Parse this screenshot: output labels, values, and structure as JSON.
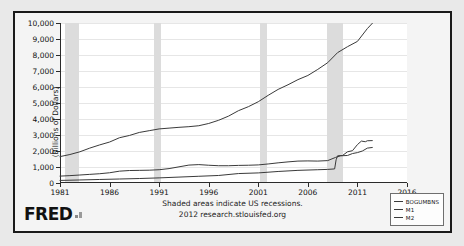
{
  "figure": {
    "logo": "FRED",
    "logo_mark": "bar-mark",
    "caption_line1": "Shaded areas indicate US recessions.",
    "caption_line2": "2012 research.stlouisfed.org"
  },
  "legend": {
    "position": "bottom-right",
    "items": [
      {
        "label": "BOGUMBNS",
        "color": "#3a3a3a"
      },
      {
        "label": "M1",
        "color": "#3a3a3a"
      },
      {
        "label": "M2",
        "color": "#3a3a3a"
      }
    ]
  },
  "chart_data": {
    "type": "line",
    "title": "",
    "xlabel": "",
    "ylabel": "(Billions of Dollars)",
    "xlim": [
      1981,
      2016
    ],
    "ylim": [
      0,
      10000
    ],
    "grid": true,
    "legend_position": "bottom-right",
    "xticks": [
      1981,
      1986,
      1991,
      1996,
      2001,
      2006,
      2011,
      2016
    ],
    "xtick_labels": [
      "1981",
      "1986",
      "1991",
      "1996",
      "2001",
      "2006",
      "2011",
      "2016"
    ],
    "yticks": [
      0,
      1000,
      2000,
      3000,
      4000,
      5000,
      6000,
      7000,
      8000,
      9000,
      10000
    ],
    "ytick_labels": [
      "0",
      "1,000",
      "2,000",
      "3,000",
      "4,000",
      "5,000",
      "6,000",
      "7,000",
      "8,000",
      "9,000",
      "10,000"
    ],
    "recessions": [
      {
        "start": 1981.5,
        "end": 1982.9
      },
      {
        "start": 1990.5,
        "end": 1991.2
      },
      {
        "start": 2001.2,
        "end": 2001.9
      },
      {
        "start": 2007.9,
        "end": 2009.5
      }
    ],
    "series": [
      {
        "name": "M2",
        "color": "#3a3a3a",
        "x": [
          1981,
          1982,
          1983,
          1984,
          1985,
          1986,
          1987,
          1988,
          1989,
          1990,
          1991,
          1992,
          1993,
          1994,
          1995,
          1996,
          1997,
          1998,
          1999,
          2000,
          2001,
          2002,
          2003,
          2004,
          2005,
          2006,
          2007,
          2008,
          2009,
          2010,
          2011,
          2012,
          2012.5
        ],
        "values": [
          1650,
          1780,
          1950,
          2180,
          2380,
          2560,
          2830,
          2970,
          3160,
          3270,
          3380,
          3430,
          3480,
          3520,
          3580,
          3720,
          3920,
          4180,
          4520,
          4770,
          5080,
          5480,
          5850,
          6140,
          6460,
          6720,
          7100,
          7520,
          8150,
          8520,
          8850,
          9650,
          9980
        ]
      },
      {
        "name": "M1",
        "color": "#3a3a3a",
        "x": [
          1981,
          1982,
          1983,
          1984,
          1985,
          1986,
          1987,
          1988,
          1989,
          1990,
          1991,
          1992,
          1993,
          1994,
          1995,
          1996,
          1997,
          1998,
          1999,
          2000,
          2001,
          2002,
          2003,
          2004,
          2005,
          2006,
          2007,
          2008,
          2008.8,
          2009.3,
          2010,
          2010.5,
          2011,
          2011.5,
          2012,
          2012.5
        ],
        "values": [
          430,
          460,
          500,
          540,
          580,
          640,
          740,
          780,
          790,
          800,
          830,
          900,
          1010,
          1120,
          1150,
          1110,
          1080,
          1080,
          1100,
          1110,
          1130,
          1190,
          1260,
          1320,
          1370,
          1380,
          1370,
          1400,
          1600,
          1700,
          1720,
          1840,
          1900,
          2000,
          2180,
          2220
        ]
      },
      {
        "name": "BOGUMBNS",
        "color": "#3a3a3a",
        "x": [
          1981,
          1983,
          1985,
          1987,
          1989,
          1991,
          1993,
          1995,
          1997,
          1999,
          2001,
          2003,
          2005,
          2007,
          2008,
          2008.7,
          2008.85,
          2009,
          2009.5,
          2010,
          2010.5,
          2011,
          2011.4,
          2011.8,
          2012,
          2012.5
        ],
        "values": [
          160,
          190,
          220,
          250,
          280,
          320,
          370,
          420,
          470,
          590,
          630,
          720,
          790,
          830,
          850,
          880,
          1450,
          1700,
          1720,
          1950,
          2020,
          2400,
          2620,
          2580,
          2640,
          2650
        ]
      }
    ]
  }
}
